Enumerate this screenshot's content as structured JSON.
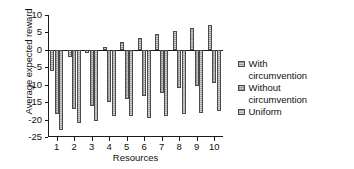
{
  "chart_data": {
    "type": "bar",
    "title": "",
    "xlabel": "Resources",
    "ylabel": "Average expected reward",
    "categories": [
      "1",
      "2",
      "3",
      "4",
      "5",
      "6",
      "7",
      "8",
      "9",
      "10"
    ],
    "ylim": [
      -25,
      10
    ],
    "yticks": [
      10,
      5,
      0,
      -5,
      -10,
      -15,
      -20,
      -25
    ],
    "ytick_labels": [
      "10",
      "5",
      "0",
      "-5",
      "-10",
      "-15",
      "-20",
      "-25"
    ],
    "grid": false,
    "legend_position": "right",
    "series": [
      {
        "name": "With circumvention",
        "values": [
          -6.0,
          -2.0,
          -1.0,
          0.7,
          2.2,
          3.5,
          4.6,
          5.5,
          6.3,
          7.2
        ]
      },
      {
        "name": "Without circumvention",
        "values": [
          -18.5,
          -17.0,
          -16.0,
          -15.0,
          -14.0,
          -13.2,
          -12.3,
          -11.0,
          -10.3,
          -9.5
        ]
      },
      {
        "name": "Uniform",
        "values": [
          -23.0,
          -21.0,
          -20.3,
          -19.0,
          -19.0,
          -19.5,
          -19.0,
          -18.3,
          -18.0,
          -17.5
        ]
      }
    ]
  },
  "legend": {
    "entries": [
      {
        "label_line1": "With",
        "label_line2": "circumvention"
      },
      {
        "label_line1": "Without",
        "label_line2": "circumvention"
      },
      {
        "label_line1": "Uniform",
        "label_line2": ""
      }
    ]
  },
  "colors": {
    "series1": "#9a9a9a",
    "series2": "#cfcfcf",
    "series3": "#a7a7a7",
    "axis": "#1a1a1a",
    "background": "#ffffff"
  }
}
